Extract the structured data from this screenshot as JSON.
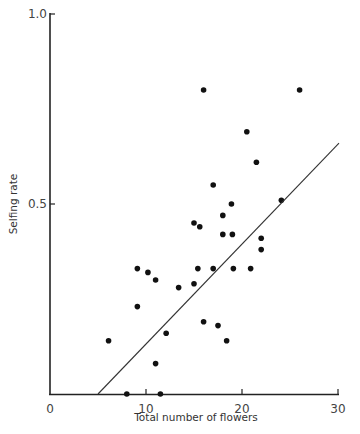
{
  "chart_data": {
    "type": "scatter",
    "title": "",
    "xlabel": "Total number of flowers",
    "ylabel": "Selfing rate",
    "xlim": [
      0,
      30
    ],
    "ylim": [
      0,
      1.0
    ],
    "x_ticks": [
      0,
      10,
      20,
      30
    ],
    "x_tick_labels": [
      "0",
      "10",
      "20",
      "30"
    ],
    "y_ticks": [
      0,
      0.5,
      1.0
    ],
    "y_tick_labels": [
      "",
      "0.5",
      "1.0"
    ],
    "grid": false,
    "legend": null,
    "series": [
      {
        "name": "observations",
        "marker": "filled-circle",
        "points": [
          [
            6.1,
            0.14
          ],
          [
            9.1,
            0.33
          ],
          [
            10.2,
            0.32
          ],
          [
            11.0,
            0.3
          ],
          [
            13.4,
            0.28
          ],
          [
            9.1,
            0.23
          ],
          [
            12.1,
            0.16
          ],
          [
            11.0,
            0.08
          ],
          [
            8.0,
            0.0
          ],
          [
            11.5,
            0.0
          ],
          [
            16.0,
            0.8
          ],
          [
            26.0,
            0.8
          ],
          [
            20.5,
            0.69
          ],
          [
            21.5,
            0.61
          ],
          [
            24.1,
            0.51
          ],
          [
            15.0,
            0.45
          ],
          [
            15.6,
            0.44
          ],
          [
            17.0,
            0.55
          ],
          [
            18.0,
            0.47
          ],
          [
            18.9,
            0.5
          ],
          [
            18.0,
            0.42
          ],
          [
            19.0,
            0.42
          ],
          [
            15.4,
            0.33
          ],
          [
            17.0,
            0.33
          ],
          [
            19.1,
            0.33
          ],
          [
            20.9,
            0.33
          ],
          [
            15.0,
            0.29
          ],
          [
            22.0,
            0.41
          ],
          [
            22.0,
            0.38
          ],
          [
            16.0,
            0.19
          ],
          [
            17.5,
            0.18
          ],
          [
            18.4,
            0.14
          ]
        ]
      }
    ],
    "regression_line": {
      "x": [
        5.0,
        30.0
      ],
      "y": [
        0.0,
        0.66
      ]
    }
  }
}
